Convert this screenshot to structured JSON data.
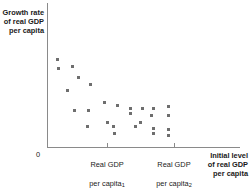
{
  "chart_data": {
    "type": "scatter",
    "title": "",
    "subtitle": "",
    "ylabel": "Growth rate\nof real GDP\nper capita",
    "xlabel": "Initial level\nof real GDP\nper capita",
    "origin_label": "0",
    "grid": false,
    "legend": null,
    "xlim": [
      0,
      1
    ],
    "ylim": [
      0,
      1
    ],
    "xtick_labels": [
      {
        "label_line1": "Real GDP",
        "label_line2": "per capita",
        "subscript": "1",
        "x": 0.311
      },
      {
        "label_line1": "Real GDP",
        "label_line2": "per capita",
        "subscript": "2",
        "x": 0.658
      }
    ],
    "annotation": "Negative relationship: countries starting with lower real GDP per capita tend to show higher growth rates (convergence).",
    "points": [
      {
        "x": 0.0554,
        "y": 0.6111
      },
      {
        "x": 0.0588,
        "y": 0.5417
      },
      {
        "x": 0.1311,
        "y": 0.5625
      },
      {
        "x": 0.1623,
        "y": 0.4812
      },
      {
        "x": 0.2264,
        "y": 0.4306
      },
      {
        "x": 0.1073,
        "y": 0.3896
      },
      {
        "x": 0.1415,
        "y": 0.2569
      },
      {
        "x": 0.214,
        "y": 0.2569
      },
      {
        "x": 0.3005,
        "y": 0.3083
      },
      {
        "x": 0.3627,
        "y": 0.2903
      },
      {
        "x": 0.4301,
        "y": 0.2708
      },
      {
        "x": 0.4974,
        "y": 0.2653
      },
      {
        "x": 0.5544,
        "y": 0.2639
      },
      {
        "x": 0.4352,
        "y": 0.2292
      },
      {
        "x": 0.5389,
        "y": 0.2188
      },
      {
        "x": 0.3109,
        "y": 0.1736
      },
      {
        "x": 0.487,
        "y": 0.1736
      },
      {
        "x": 0.2109,
        "y": 0.1424
      },
      {
        "x": 0.342,
        "y": 0.1458
      },
      {
        "x": 0.456,
        "y": 0.1389
      },
      {
        "x": 0.5544,
        "y": 0.1319
      },
      {
        "x": 0.6321,
        "y": 0.1181
      },
      {
        "x": 0.3472,
        "y": 0.0972
      },
      {
        "x": 0.5544,
        "y": 0.0903
      },
      {
        "x": 0.6321,
        "y": 0.0764
      },
      {
        "x": 0.6321,
        "y": 0.2778
      },
      {
        "x": 0.6321,
        "y": 0.2222
      }
    ]
  }
}
